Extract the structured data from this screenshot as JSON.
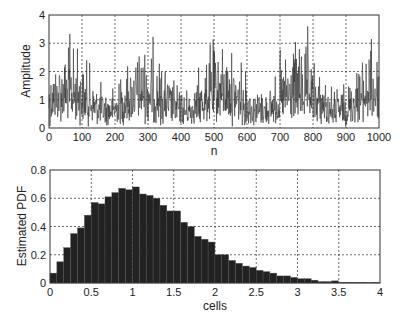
{
  "chart_data": [
    {
      "type": "line",
      "title": "",
      "xlabel": "n",
      "ylabel": "Amplitude",
      "xlim": [
        0,
        1000
      ],
      "ylim": [
        0,
        4
      ],
      "xticks": [
        0,
        100,
        200,
        300,
        400,
        500,
        600,
        700,
        800,
        900,
        1000
      ],
      "yticks": [
        0,
        1,
        2,
        3,
        4
      ],
      "grid": true,
      "series": [
        {
          "name": "amplitude",
          "description": "noisy random amplitude sequence, 1000 samples, mean ~1.1, peaks up to ~3.6",
          "n_points": 1000,
          "mean": 1.1,
          "max": 3.6,
          "min": 0.05,
          "color": "#333333"
        }
      ]
    },
    {
      "type": "bar",
      "title": "",
      "xlabel": "cells",
      "ylabel": "Estimated PDF",
      "xlim": [
        0,
        4
      ],
      "ylim": [
        0,
        0.8
      ],
      "xticks": [
        "0",
        "0.5",
        "1",
        "1.5",
        "2",
        "2.5",
        "3",
        "3.5",
        "4"
      ],
      "yticks": [
        "0",
        "0.2",
        "0.4",
        "0.6",
        "0.8"
      ],
      "grid": true,
      "bin_width": 0.0833,
      "bar_color": "#222222",
      "values": [
        0.07,
        0.15,
        0.25,
        0.35,
        0.39,
        0.48,
        0.57,
        0.56,
        0.61,
        0.64,
        0.67,
        0.66,
        0.68,
        0.63,
        0.62,
        0.6,
        0.55,
        0.51,
        0.51,
        0.43,
        0.4,
        0.33,
        0.31,
        0.29,
        0.2,
        0.2,
        0.16,
        0.14,
        0.12,
        0.11,
        0.09,
        0.08,
        0.07,
        0.05,
        0.05,
        0.04,
        0.03,
        0.03,
        0.02,
        0.01,
        0.01,
        0.015,
        0.005,
        0.005,
        0.005,
        0.005,
        0.002,
        0.005
      ]
    }
  ]
}
